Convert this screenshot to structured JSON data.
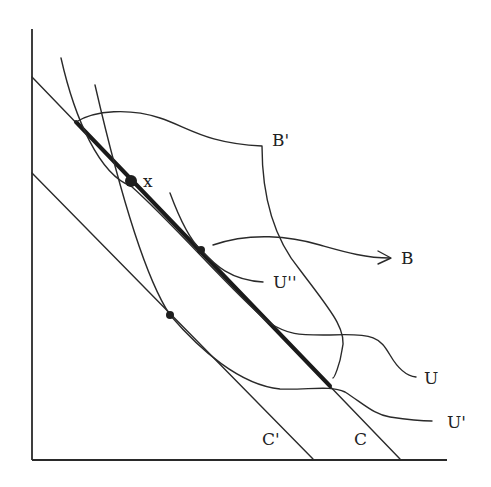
{
  "diagram": {
    "type": "economics-indifference-budget-diagram",
    "labels": {
      "x_point": "x",
      "B_prime": "B'",
      "B": "B",
      "U_double_prime": "U''",
      "U": "U",
      "U_prime": "U'",
      "C_prime": "C'",
      "C": "C"
    },
    "colors": {
      "ink": "#2a2a2a",
      "background": "#ffffff"
    },
    "elements": [
      {
        "name": "budget-line-C",
        "label": "C",
        "from": [
          32,
          77
        ],
        "to": [
          400,
          459
        ]
      },
      {
        "name": "budget-line-C-prime",
        "label": "C'",
        "from": [
          32,
          173
        ],
        "to": [
          313,
          459
        ]
      },
      {
        "name": "thick-segment",
        "from": [
          76,
          122
        ],
        "to": [
          330,
          386
        ]
      },
      {
        "name": "curve-U",
        "label": "U"
      },
      {
        "name": "curve-U-prime",
        "label": "U'"
      },
      {
        "name": "curve-U-double-prime",
        "label": "U''"
      },
      {
        "name": "curve-B-prime",
        "label": "B'"
      },
      {
        "name": "arrow-B",
        "label": "B"
      },
      {
        "name": "point-x",
        "label": "x",
        "at": [
          131,
          181
        ]
      },
      {
        "name": "tangency-point-U-double-prime",
        "at": [
          201,
          250
        ]
      },
      {
        "name": "tangency-point-C-prime",
        "at": [
          170,
          315
        ]
      }
    ]
  }
}
